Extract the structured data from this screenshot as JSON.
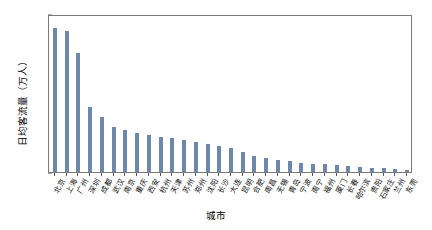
{
  "chart_data": {
    "type": "bar",
    "title": "",
    "xlabel": "城市",
    "ylabel": "日均客流量（万人）",
    "ylim": [
      0,
      1200
    ],
    "yticks": [
      0,
      200,
      400,
      600,
      800,
      1000,
      1200
    ],
    "grid": false,
    "legend": null,
    "bar_color": "#6e87ad",
    "categories": [
      "北京",
      "上海",
      "广州",
      "深圳",
      "成都",
      "武汉",
      "南京",
      "重庆",
      "西安",
      "杭州",
      "天津",
      "苏州",
      "郑州",
      "沈阳",
      "长沙",
      "大连",
      "昆明",
      "合肥",
      "南昌",
      "无锡",
      "青岛",
      "宁波",
      "南宁",
      "福州",
      "厦门",
      "长春",
      "哈尔滨",
      "贵阳",
      "石家庄",
      "兰州",
      "东莞"
    ],
    "values": [
      1090,
      1068,
      905,
      490,
      418,
      343,
      318,
      300,
      282,
      268,
      255,
      240,
      228,
      212,
      196,
      180,
      152,
      120,
      104,
      92,
      80,
      72,
      64,
      58,
      52,
      46,
      40,
      34,
      28,
      22,
      14
    ]
  }
}
